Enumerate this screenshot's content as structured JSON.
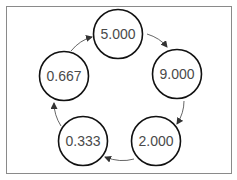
{
  "diagram": {
    "type": "cycle",
    "nodes": [
      {
        "id": "n1",
        "label": "5.000",
        "cx": 118,
        "cy": 34
      },
      {
        "id": "n2",
        "label": "9.000",
        "cx": 177,
        "cy": 74
      },
      {
        "id": "n3",
        "label": "2.000",
        "cx": 156,
        "cy": 141
      },
      {
        "id": "n4",
        "label": "0.333",
        "cx": 83,
        "cy": 141
      },
      {
        "id": "n5",
        "label": "0.667",
        "cx": 64,
        "cy": 76
      }
    ],
    "edges": [
      {
        "from": "5.000",
        "to": "9.000"
      },
      {
        "from": "9.000",
        "to": "2.000"
      },
      {
        "from": "2.000",
        "to": "0.333"
      },
      {
        "from": "0.333",
        "to": "0.667"
      },
      {
        "from": "0.667",
        "to": "5.000"
      }
    ],
    "colors": {
      "frame": "#8a8a8a",
      "circle_stroke": "#111111",
      "text": "#4a4a4a",
      "arrow": "#333333"
    }
  }
}
